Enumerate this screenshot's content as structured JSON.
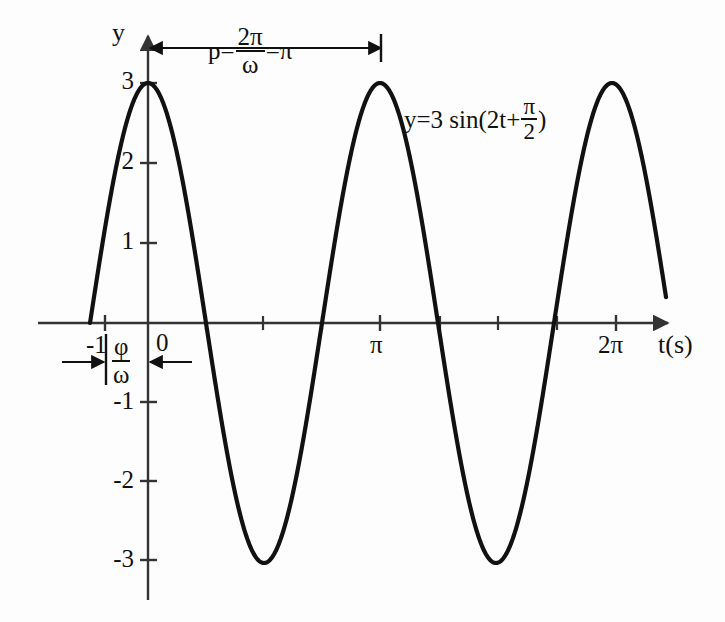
{
  "chart_data": {
    "type": "line",
    "title": "",
    "subtitle": "",
    "xlabel": "t(s)",
    "ylabel": "y",
    "xlim": [
      -1.35,
      7.6
    ],
    "ylim": [
      -3.6,
      3.6
    ],
    "grid": false,
    "legend": false,
    "function": "y = 3 sin(2t + pi/2)",
    "amplitude": 3,
    "angular_frequency": 2,
    "phase": 1.5707963,
    "period": 3.14159,
    "phase_shift": -0.785398,
    "x_ticks": [
      {
        "value": -1,
        "label": "-1"
      },
      {
        "value": 0,
        "label": "0"
      },
      {
        "value": 3.14159,
        "label": "π"
      },
      {
        "value": 6.28319,
        "label": "2π"
      }
    ],
    "x_minor_ticks": [
      0.7854,
      1.5708,
      2.3562,
      3.927,
      4.7124,
      5.4978
    ],
    "y_ticks": [
      {
        "value": 3,
        "label": "3"
      },
      {
        "value": 2,
        "label": "2"
      },
      {
        "value": 1,
        "label": "1"
      },
      {
        "value": -1,
        "label": "-1"
      },
      {
        "value": -2,
        "label": "-2"
      },
      {
        "value": -3,
        "label": "-3"
      }
    ],
    "series": [
      {
        "name": "y=3 sin(2t+π/2)",
        "color": "#111111",
        "x": [
          -0.7854,
          -0.7,
          -0.6,
          -0.5,
          -0.4,
          -0.3,
          -0.2,
          -0.1,
          0.0,
          0.1,
          0.2,
          0.3,
          0.4,
          0.5,
          0.6,
          0.7,
          0.7854,
          0.9,
          1.0,
          1.1,
          1.2,
          1.3,
          1.4,
          1.5,
          1.5708,
          1.7,
          1.8,
          1.9,
          2.0,
          2.1,
          2.2,
          2.3,
          2.3562,
          2.5,
          2.6,
          2.7,
          2.8,
          2.9,
          3.0,
          3.1,
          3.14159,
          3.3,
          3.4,
          3.5,
          3.6,
          3.7,
          3.8,
          3.927,
          4.1,
          4.2,
          4.3,
          4.4,
          4.5,
          4.6,
          4.7124,
          4.9,
          5.0,
          5.1,
          5.2,
          5.3,
          5.4,
          5.4978,
          5.7,
          5.8,
          5.9,
          6.0,
          6.1,
          6.2,
          6.28319,
          6.5,
          6.6,
          6.7,
          6.8,
          6.9,
          7.0
        ],
        "y": [
          0.0,
          0.459,
          0.892,
          1.288,
          1.654,
          1.986,
          2.272,
          2.504,
          3.0,
          2.97,
          2.88,
          2.735,
          2.53,
          2.268,
          1.956,
          1.6,
          0.0,
          0.746,
          1.248,
          1.702,
          2.1,
          2.42,
          2.66,
          2.86,
          0.0,
          -2.1,
          -2.36,
          -2.62,
          -2.82,
          -2.94,
          -3.0,
          -2.97,
          0.0,
          2.25,
          2.56,
          2.78,
          2.92,
          2.99,
          2.98,
          2.92,
          3.0,
          2.54,
          2.13,
          1.68,
          1.17,
          0.6,
          0.0,
          0.0,
          -1.4,
          -1.95,
          -2.38,
          -2.72,
          -2.92,
          -3.0,
          0.0,
          2.66,
          2.38,
          2.05,
          1.66,
          1.22,
          0.75,
          0.0,
          -1.15,
          -1.68,
          -2.13,
          -2.52,
          -2.8,
          -2.96,
          0.0,
          2.0,
          2.4,
          2.7,
          2.9,
          2.98,
          3.0
        ]
      }
    ],
    "annotations": [
      {
        "name": "period-annotation",
        "text_parts": {
          "prefix": "p=",
          "fraction_numerator": "2π",
          "fraction_denominator": "ω",
          "suffix": "=π"
        },
        "from_x": 0,
        "to_x": 3.14159,
        "at_y": 3.45,
        "arrow": "double"
      },
      {
        "name": "phase-shift-annotation",
        "text_parts": {
          "fraction_numerator": "φ",
          "fraction_denominator": "ω"
        },
        "from_x": -0.7854,
        "to_x": 0,
        "at_y": -0.48,
        "arrow": "double"
      },
      {
        "name": "equation-annotation",
        "text_parts": {
          "prefix": "y=3 sin(2t+",
          "fraction_numerator": "π",
          "fraction_denominator": "2",
          "suffix": ")"
        },
        "at_x": 3.4,
        "at_y": 2.65
      }
    ]
  },
  "axes": {
    "y_axis_label": "y",
    "x_axis_label": "t(s)"
  },
  "colors": {
    "curve": "#111111",
    "axis": "#333333",
    "text": "#111111",
    "background": "#fdfdfd"
  }
}
